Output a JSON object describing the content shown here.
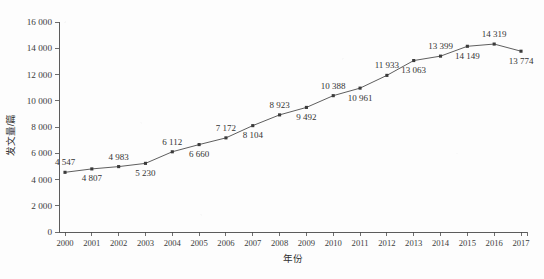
{
  "chart_data": {
    "type": "line",
    "title": "",
    "xlabel": "年份",
    "ylabel": "发文量/篇",
    "categories": [
      "2000",
      "2001",
      "2002",
      "2003",
      "2004",
      "2005",
      "2006",
      "2007",
      "2008",
      "2009",
      "2010",
      "2011",
      "2012",
      "2013",
      "2014",
      "2015",
      "2016",
      "2017"
    ],
    "values": [
      4547,
      4807,
      4983,
      5230,
      6112,
      6660,
      7172,
      8104,
      8923,
      9492,
      10388,
      10961,
      11933,
      13063,
      13399,
      14149,
      14319,
      13774
    ],
    "point_labels": [
      "4 547",
      "4 807",
      "4 983",
      "5 230",
      "6 112",
      "6 660",
      "7 172",
      "8 104",
      "8 923",
      "9 492",
      "10 388",
      "10 961",
      "11 933",
      "13 063",
      "13 399",
      "14 149",
      "14 319",
      "13 774"
    ],
    "label_positions": [
      "above",
      "below",
      "above",
      "below",
      "above",
      "below",
      "above",
      "below",
      "above",
      "below",
      "above",
      "below",
      "above",
      "below",
      "above",
      "below",
      "above",
      "below"
    ],
    "ylim": [
      0,
      16000
    ],
    "ytick_values": [
      0,
      2000,
      4000,
      6000,
      8000,
      10000,
      12000,
      14000,
      16000
    ],
    "ytick_labels": [
      "0",
      "2 000",
      "4 000",
      "6 000",
      "8 000",
      "10 000",
      "12 000",
      "14 000",
      "16 000"
    ],
    "grid": false,
    "legend": null,
    "marker": "square",
    "series_color": "#555555",
    "marker_color": "#3b3b3b",
    "axis_color": "#4a4a4a"
  }
}
